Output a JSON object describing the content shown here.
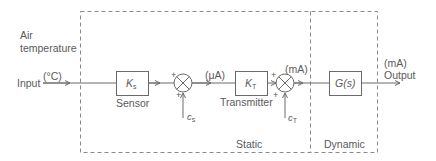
{
  "diagram": {
    "input": {
      "label_line1": "Air",
      "label_line2": "temperature",
      "label": "Input",
      "unit": "(°C)"
    },
    "blocks": [
      {
        "id": "sensor",
        "symbol": "K",
        "subscript": "s",
        "caption": "Sensor"
      },
      {
        "id": "transmitter",
        "symbol": "K",
        "subscript": "T",
        "caption": "Transmitter"
      },
      {
        "id": "dynamic",
        "symbol": "G(s)",
        "caption": ""
      }
    ],
    "summing_junctions": [
      {
        "id": "sum1",
        "signs": [
          "+",
          "+"
        ],
        "disturbance": "c",
        "disturbance_subscript": "s"
      },
      {
        "id": "sum2",
        "signs": [
          "+",
          "+"
        ],
        "disturbance": "c",
        "disturbance_subscript": "T"
      }
    ],
    "signals": {
      "after_sum1_unit": "(μA)",
      "after_sum2_unit": "(mA)"
    },
    "output": {
      "unit": "(mA)",
      "label": "Output"
    },
    "regions": [
      {
        "id": "static",
        "label": "Static"
      },
      {
        "id": "dynamic",
        "label": "Dynamic"
      }
    ],
    "colors": {
      "line": "#6a6a6a",
      "text": "#5a5a5a",
      "background": "#ffffff"
    }
  }
}
